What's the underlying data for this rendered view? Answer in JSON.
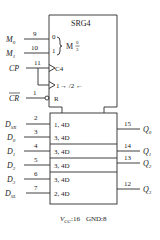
{
  "chip": {
    "title": "SRG4",
    "mode_label": "M",
    "mode_fraction_top": "0",
    "mode_fraction_bottom": "3",
    "mode_input_0": "0",
    "mode_input_1": "1",
    "clock_label": "C4",
    "shift_label": "1",
    "shift_arrows": "→ /2 ←",
    "reset_label": "R"
  },
  "inputs": [
    {
      "name": "M",
      "sub": "0",
      "pin": "9"
    },
    {
      "name": "M",
      "sub": "1",
      "pin": "10"
    },
    {
      "name": "CP",
      "sub": "",
      "pin": "11"
    },
    {
      "name": "CR",
      "sub": "",
      "pin": "1",
      "overbar": true
    }
  ],
  "data_inputs": [
    {
      "name": "D",
      "sub": "SR",
      "pin": "2",
      "cell": "1, 4D"
    },
    {
      "name": "D",
      "sub": "0",
      "pin": "3",
      "cell": "3, 4D"
    },
    {
      "name": "D",
      "sub": "1",
      "pin": "4",
      "cell": "3, 4D"
    },
    {
      "name": "D",
      "sub": "2",
      "pin": "5",
      "cell": "3, 4D"
    },
    {
      "name": "D",
      "sub": "3",
      "pin": "6",
      "cell": "3, 4D"
    },
    {
      "name": "D",
      "sub": "SL",
      "pin": "7",
      "cell": "2, 4D"
    }
  ],
  "outputs": [
    {
      "name": "Q",
      "sub": "0",
      "pin": "15"
    },
    {
      "name": "Q",
      "sub": "1",
      "pin": "14"
    },
    {
      "name": "Q",
      "sub": "2",
      "pin": "13"
    },
    {
      "name": "Q",
      "sub": "3",
      "pin": "12"
    }
  ],
  "power": {
    "vcc_name": "V",
    "vcc_sub": "CC",
    "vcc_pin": ":16",
    "gnd": "GND:8"
  }
}
